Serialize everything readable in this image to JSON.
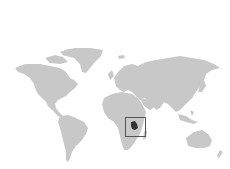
{
  "map": {
    "type": "world-locator",
    "background_color": "#ffffff",
    "land_color": "#c8c8c8",
    "highlight_color": "#333333",
    "locator_box_color": "#555555",
    "highlighted_region": "East Africa (Tanzania)"
  }
}
